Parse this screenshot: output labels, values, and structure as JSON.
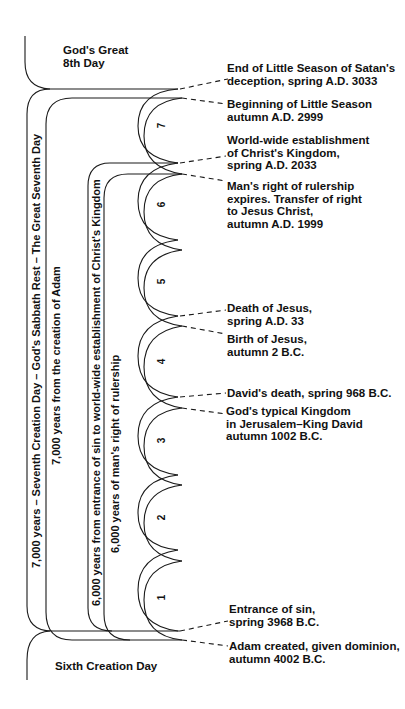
{
  "diagram": {
    "corner_labels": {
      "top": [
        "God's Great",
        "8th Day"
      ],
      "bottom": "Sixth Creation Day"
    },
    "vertical_labels": [
      "7,000 years – Seventh Creation Day – God's Sabbath Rest – The Great Seventh Day",
      "7,000 years from the creation of Adam",
      "6,000 years from entrance of sin to world-wide establishment of Christ's Kingdom",
      "6,000 years of man's right of rulership"
    ],
    "millennium_numbers": [
      "7",
      "6",
      "5",
      "4",
      "3",
      "2",
      "1"
    ],
    "events": [
      {
        "id": "end-little-season",
        "lines": [
          "End of Little Season of Satan's",
          "deception, spring A.D. 3033"
        ]
      },
      {
        "id": "begin-little-season",
        "lines": [
          "Beginning of Little Season",
          "autumn A.D. 2999"
        ]
      },
      {
        "id": "kingdom-established",
        "lines": [
          "World-wide establishment",
          "of Christ's Kingdom,",
          "spring A.D. 2033"
        ]
      },
      {
        "id": "rulership-expires",
        "lines": [
          "Man's right of rulership",
          "expires. Transfer of right",
          "to Jesus Christ,",
          "autumn A.D. 1999"
        ]
      },
      {
        "id": "death-of-jesus",
        "lines": [
          "Death of Jesus,",
          "spring A.D. 33"
        ]
      },
      {
        "id": "birth-of-jesus",
        "lines": [
          "Birth of Jesus,",
          "autumn 2 B.C."
        ]
      },
      {
        "id": "davids-death",
        "lines": [
          "David's death, spring  968 B.C."
        ]
      },
      {
        "id": "typical-kingdom",
        "lines": [
          "God's typical Kingdom",
          "in Jerusalem–King David",
          "autumn 1002 B.C."
        ]
      },
      {
        "id": "entrance-of-sin",
        "lines": [
          "Entrance of sin,",
          "spring 3968 B.C."
        ]
      },
      {
        "id": "adam-created",
        "lines": [
          "Adam created, given dominion,",
          "autumn 4002 B.C."
        ]
      }
    ],
    "colors": {
      "line": "#1a1a1a",
      "background": "#ffffff"
    }
  }
}
